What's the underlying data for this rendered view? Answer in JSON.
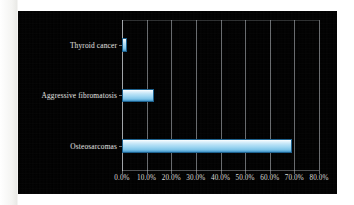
{
  "figure": {
    "background_color": "#000000",
    "paper_color": "#fdfdfc",
    "bar_color": "#9fd6f2",
    "bar_edge_color": "#1e628f",
    "gridline_color": "#bec3c8",
    "text_color": "#d9d9d6"
  },
  "chart_data": {
    "type": "bar",
    "orientation": "horizontal",
    "title": "",
    "xlabel": "",
    "ylabel": "",
    "categories": [
      "Thyroid cancer",
      "Aggressive fibromatosis",
      "Osteosarcomas"
    ],
    "values": [
      2.0,
      13.0,
      69.0
    ],
    "value_unit": "%",
    "xlim": [
      0,
      80
    ],
    "xticks": [
      0,
      10,
      20,
      30,
      40,
      50,
      60,
      70,
      80
    ],
    "xticklabels": [
      "0.0%",
      "10.0%",
      "20.0%",
      "30.0%",
      "40.0%",
      "50.0%",
      "60.0%",
      "70.0%",
      "80.0%"
    ],
    "grid": true,
    "grid_axis": "x",
    "legend": false,
    "legend_position": "none"
  }
}
